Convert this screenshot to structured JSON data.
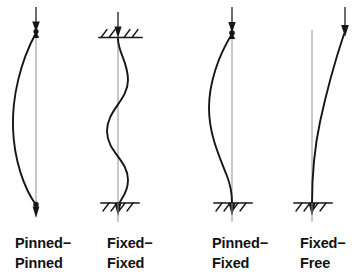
{
  "figure": {
    "background_color": "#ffffff",
    "line_color": "#15161a",
    "axis_color": "#8f9094",
    "text_color": "#111111"
  },
  "columns": [
    {
      "id": "pinned-pinned",
      "caption_line1": "Pinned−",
      "caption_line2": "Pinned",
      "top_support": "pinned",
      "bottom_support": "pinned",
      "load_arrow": "down-arrow-top",
      "mode_shape": "half-sine bowing left",
      "effective_length_factor": "1.0",
      "center_x": 36,
      "buckle_direction": "left"
    },
    {
      "id": "fixed-fixed",
      "caption_line1": "Fixed−",
      "caption_line2": "Fixed",
      "top_support": "fixed",
      "bottom_support": "fixed",
      "load_arrow": "down-arrow-top",
      "mode_shape": "S-curve with two inflection points",
      "effective_length_factor": "0.5",
      "center_x": 118,
      "buckle_direction": "s-curve"
    },
    {
      "id": "pinned-fixed",
      "caption_line1": "Pinned−",
      "caption_line2": "Fixed",
      "top_support": "pinned",
      "bottom_support": "fixed",
      "load_arrow": "down-arrow-top",
      "mode_shape": "bow left with tangent base",
      "effective_length_factor": "0.7",
      "center_x": 232,
      "buckle_direction": "left"
    },
    {
      "id": "fixed-free",
      "caption_line1": "Fixed−",
      "caption_line2": "Free",
      "top_support": "free",
      "bottom_support": "fixed",
      "load_arrow": "down-arrow-top-offset",
      "mode_shape": "quarter-sine cantilever",
      "effective_length_factor": "2.0",
      "center_x": 312,
      "buckle_direction": "right"
    }
  ],
  "captions": {
    "col1_line1": "Pinned−",
    "col1_line2": "Pinned",
    "col2_line1": "Fixed−",
    "col2_line2": "Fixed",
    "col3_line1": "Pinned−",
    "col3_line2": "Fixed",
    "col4_line1": "Fixed−",
    "col4_line2": "Free"
  }
}
